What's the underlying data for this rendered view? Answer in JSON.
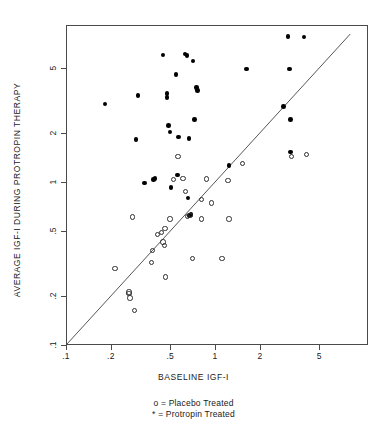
{
  "chart_data": {
    "type": "scatter",
    "title": "",
    "xlabel": "BASELINE IGF-I",
    "ylabel": "AVERAGE IGF-I DURING PROTROPIN THERAPY",
    "xscale": "log",
    "yscale": "log",
    "xlim": [
      0.1,
      8.2
    ],
    "ylim": [
      0.1,
      9.0
    ],
    "xticks": [
      0.1,
      0.2,
      0.5,
      1,
      2,
      5
    ],
    "xticklabels": [
      ".1",
      ".2",
      ".5",
      "1",
      "2",
      "5"
    ],
    "yticks": [
      0.1,
      0.2,
      0.5,
      1,
      2,
      5
    ],
    "yticklabels": [
      ".1",
      ".2",
      ".5",
      "1",
      "2",
      "5"
    ],
    "grid": false,
    "reference_line": {
      "name": "identity-line",
      "description": "y = x diagonal",
      "from": [
        0.1,
        0.1
      ],
      "to": [
        8.2,
        8.2
      ]
    },
    "legend": {
      "position": "below-axis-title",
      "entries": [
        {
          "marker": "o",
          "symbol": "open-circle",
          "label": "o = Placebo Treated"
        },
        {
          "marker": "*",
          "symbol": "filled-circle",
          "label": "* = Protropin Treated"
        }
      ]
    },
    "series": [
      {
        "name": "Protropin Treated",
        "marker": "filled-circle",
        "color": "#000000",
        "points": [
          [
            0.18,
            3.05
          ],
          [
            0.29,
            1.85
          ],
          [
            0.3,
            3.45
          ],
          [
            0.33,
            1.0
          ],
          [
            0.38,
            1.05
          ],
          [
            0.39,
            1.07
          ],
          [
            0.44,
            6.1
          ],
          [
            0.47,
            3.55
          ],
          [
            0.47,
            3.35
          ],
          [
            0.48,
            2.25
          ],
          [
            0.49,
            2.05
          ],
          [
            0.5,
            0.94
          ],
          [
            0.54,
            4.65
          ],
          [
            0.55,
            1.12
          ],
          [
            0.56,
            1.92
          ],
          [
            0.62,
            6.2
          ],
          [
            0.64,
            6.05
          ],
          [
            0.65,
            0.81
          ],
          [
            0.66,
            1.88
          ],
          [
            0.7,
            5.6
          ],
          [
            0.72,
            2.45
          ],
          [
            0.74,
            3.85
          ],
          [
            0.75,
            3.7
          ],
          [
            0.66,
            0.63
          ],
          [
            0.68,
            0.64
          ],
          [
            1.22,
            1.28
          ],
          [
            1.6,
            5.0
          ],
          [
            2.85,
            2.95
          ],
          [
            3.1,
            5.0
          ],
          [
            3.15,
            2.45
          ],
          [
            3.15,
            1.55
          ],
          [
            3.05,
            7.9
          ],
          [
            3.9,
            7.85
          ]
        ]
      },
      {
        "name": "Placebo Treated",
        "marker": "open-circle",
        "color": "#2e2e2e",
        "points": [
          [
            0.21,
            0.3
          ],
          [
            0.26,
            0.21
          ],
          [
            0.26,
            0.215
          ],
          [
            0.265,
            0.197
          ],
          [
            0.285,
            0.165
          ],
          [
            0.275,
            0.62
          ],
          [
            0.375,
            0.385
          ],
          [
            0.37,
            0.325
          ],
          [
            0.405,
            0.485
          ],
          [
            0.43,
            0.495
          ],
          [
            0.44,
            0.435
          ],
          [
            0.45,
            0.415
          ],
          [
            0.455,
            0.525
          ],
          [
            0.46,
            0.265
          ],
          [
            0.49,
            0.6
          ],
          [
            0.52,
            1.05
          ],
          [
            0.555,
            1.45
          ],
          [
            0.6,
            1.07
          ],
          [
            0.625,
            0.885
          ],
          [
            0.645,
            0.625
          ],
          [
            0.67,
            0.63
          ],
          [
            0.695,
            0.345
          ],
          [
            0.8,
            0.6
          ],
          [
            0.8,
            0.79
          ],
          [
            0.86,
            1.06
          ],
          [
            0.93,
            0.755
          ],
          [
            1.1,
            0.345
          ],
          [
            1.2,
            1.04
          ],
          [
            1.22,
            0.6
          ],
          [
            1.5,
            1.32
          ],
          [
            3.2,
            1.45
          ],
          [
            4.05,
            1.5
          ]
        ]
      }
    ]
  },
  "axis": {
    "x_title": "BASELINE IGF-I",
    "y_title": "AVERAGE IGF-I DURING PROTROPIN THERAPY"
  },
  "legend": {
    "line1": "o = Placebo Treated",
    "line2": "* = Protropin Treated"
  }
}
